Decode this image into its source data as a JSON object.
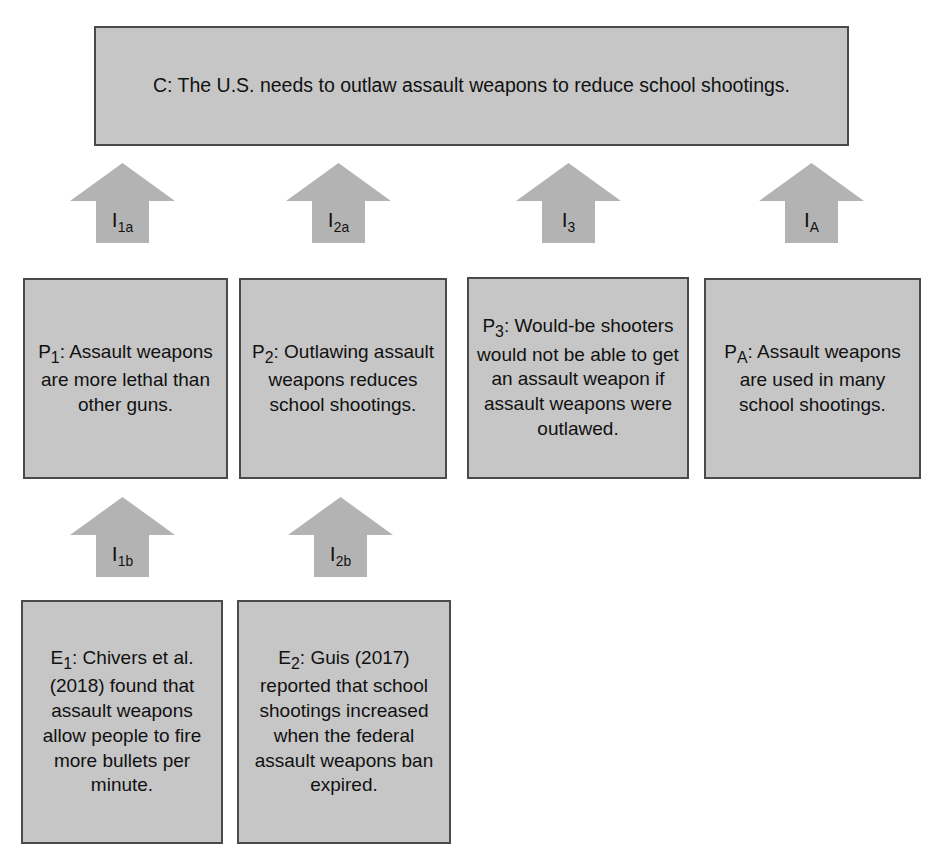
{
  "diagram": {
    "box_fill": "#c6c6c6",
    "box_border": "#4a4a4a",
    "arrow_fill": "#b3b3b3",
    "text_color": "#111111",
    "background": "#ffffff"
  },
  "conclusion": {
    "id": "C",
    "label": "C",
    "text": "C: The U.S. needs to outlaw assault weapons to reduce school shootings."
  },
  "premises": [
    {
      "id": "P1",
      "label": "P₁",
      "text": "P₁: Assault weapons are more lethal than other guns."
    },
    {
      "id": "P2",
      "label": "P₂",
      "text": "P₂: Outlawing assault weapons reduces school shootings."
    },
    {
      "id": "P3",
      "label": "P₃",
      "text": "P₃: Would-be shooters would not be able to get an assault weapon if assault weapons were outlawed."
    },
    {
      "id": "PA",
      "label": "P_A",
      "text": "P_A: Assault weapons are used in many school shootings."
    }
  ],
  "evidence": [
    {
      "id": "E1",
      "label": "E₁",
      "text": "E₁: Chivers et al. (2018) found that assault weapons allow people to fire more bullets per minute."
    },
    {
      "id": "E2",
      "label": "E₂",
      "text": "E₂: Guis (2017) reported that school shootings increased when the federal assault weapons ban expired."
    }
  ],
  "inferences": [
    {
      "id": "I1a",
      "base": "I",
      "sub": "1a",
      "from": "P1",
      "to": "C"
    },
    {
      "id": "I2a",
      "base": "I",
      "sub": "2a",
      "from": "P2",
      "to": "C"
    },
    {
      "id": "I3",
      "base": "I",
      "sub": "3",
      "from": "P3",
      "to": "C"
    },
    {
      "id": "IA",
      "base": "I",
      "sub": "A",
      "from": "PA",
      "to": "C"
    },
    {
      "id": "I1b",
      "base": "I",
      "sub": "1b",
      "from": "E1",
      "to": "P1"
    },
    {
      "id": "I2b",
      "base": "I",
      "sub": "2b",
      "from": "E2",
      "to": "P2"
    }
  ]
}
